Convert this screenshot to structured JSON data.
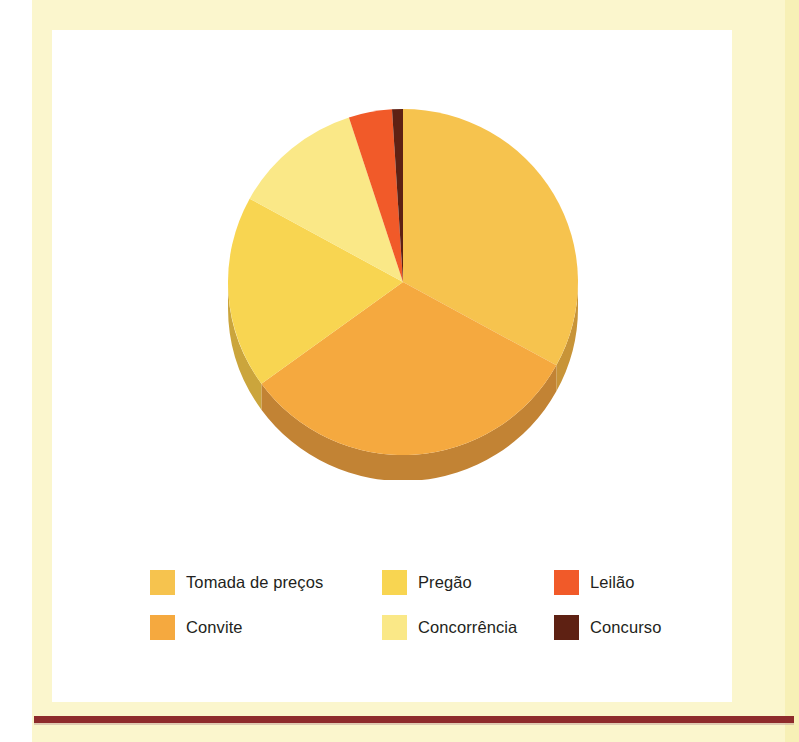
{
  "page": {
    "background_color": "#fbf6cd",
    "panel_color": "#ffffff",
    "rule_color": "#8e2b2b"
  },
  "chart_data": {
    "type": "pie",
    "title": "",
    "subtitle": "",
    "xlabel": "",
    "ylabel": "",
    "grid": false,
    "legend_position": "bottom",
    "three_d": true,
    "start_angle_deg": 0,
    "direction": "clockwise",
    "categories": [
      "Tomada de preços",
      "Convite",
      "Pregão",
      "Concorrência",
      "Leilão",
      "Concurso"
    ],
    "values": [
      33,
      32,
      18,
      12,
      4,
      1
    ],
    "units": "percent",
    "slices": [
      {
        "label": "Tomada de preços",
        "value": 33,
        "color": "#f6c34e",
        "side_color": "#c89438"
      },
      {
        "label": "Convite",
        "value": 32,
        "color": "#f5a93f",
        "side_color": "#c28334"
      },
      {
        "label": "Pregão",
        "value": 18,
        "color": "#f8d551",
        "side_color": "#cba53c"
      },
      {
        "label": "Concorrência",
        "value": 12,
        "color": "#fae887",
        "side_color": "#d3bd62"
      },
      {
        "label": "Leilão",
        "value": 4,
        "color": "#f15a29",
        "side_color": "#b7411d"
      },
      {
        "label": "Concurso",
        "value": 1,
        "color": "#5e2113",
        "side_color": "#45170d"
      }
    ]
  },
  "legend": {
    "items": [
      {
        "label": "Tomada de preços",
        "color": "#f6c34e"
      },
      {
        "label": "Pregão",
        "color": "#f8d551"
      },
      {
        "label": "Leilão",
        "color": "#f15a29"
      },
      {
        "label": "Convite",
        "color": "#f5a93f"
      },
      {
        "label": "Concorrência",
        "color": "#fae887"
      },
      {
        "label": "Concurso",
        "color": "#5e2113"
      }
    ]
  }
}
